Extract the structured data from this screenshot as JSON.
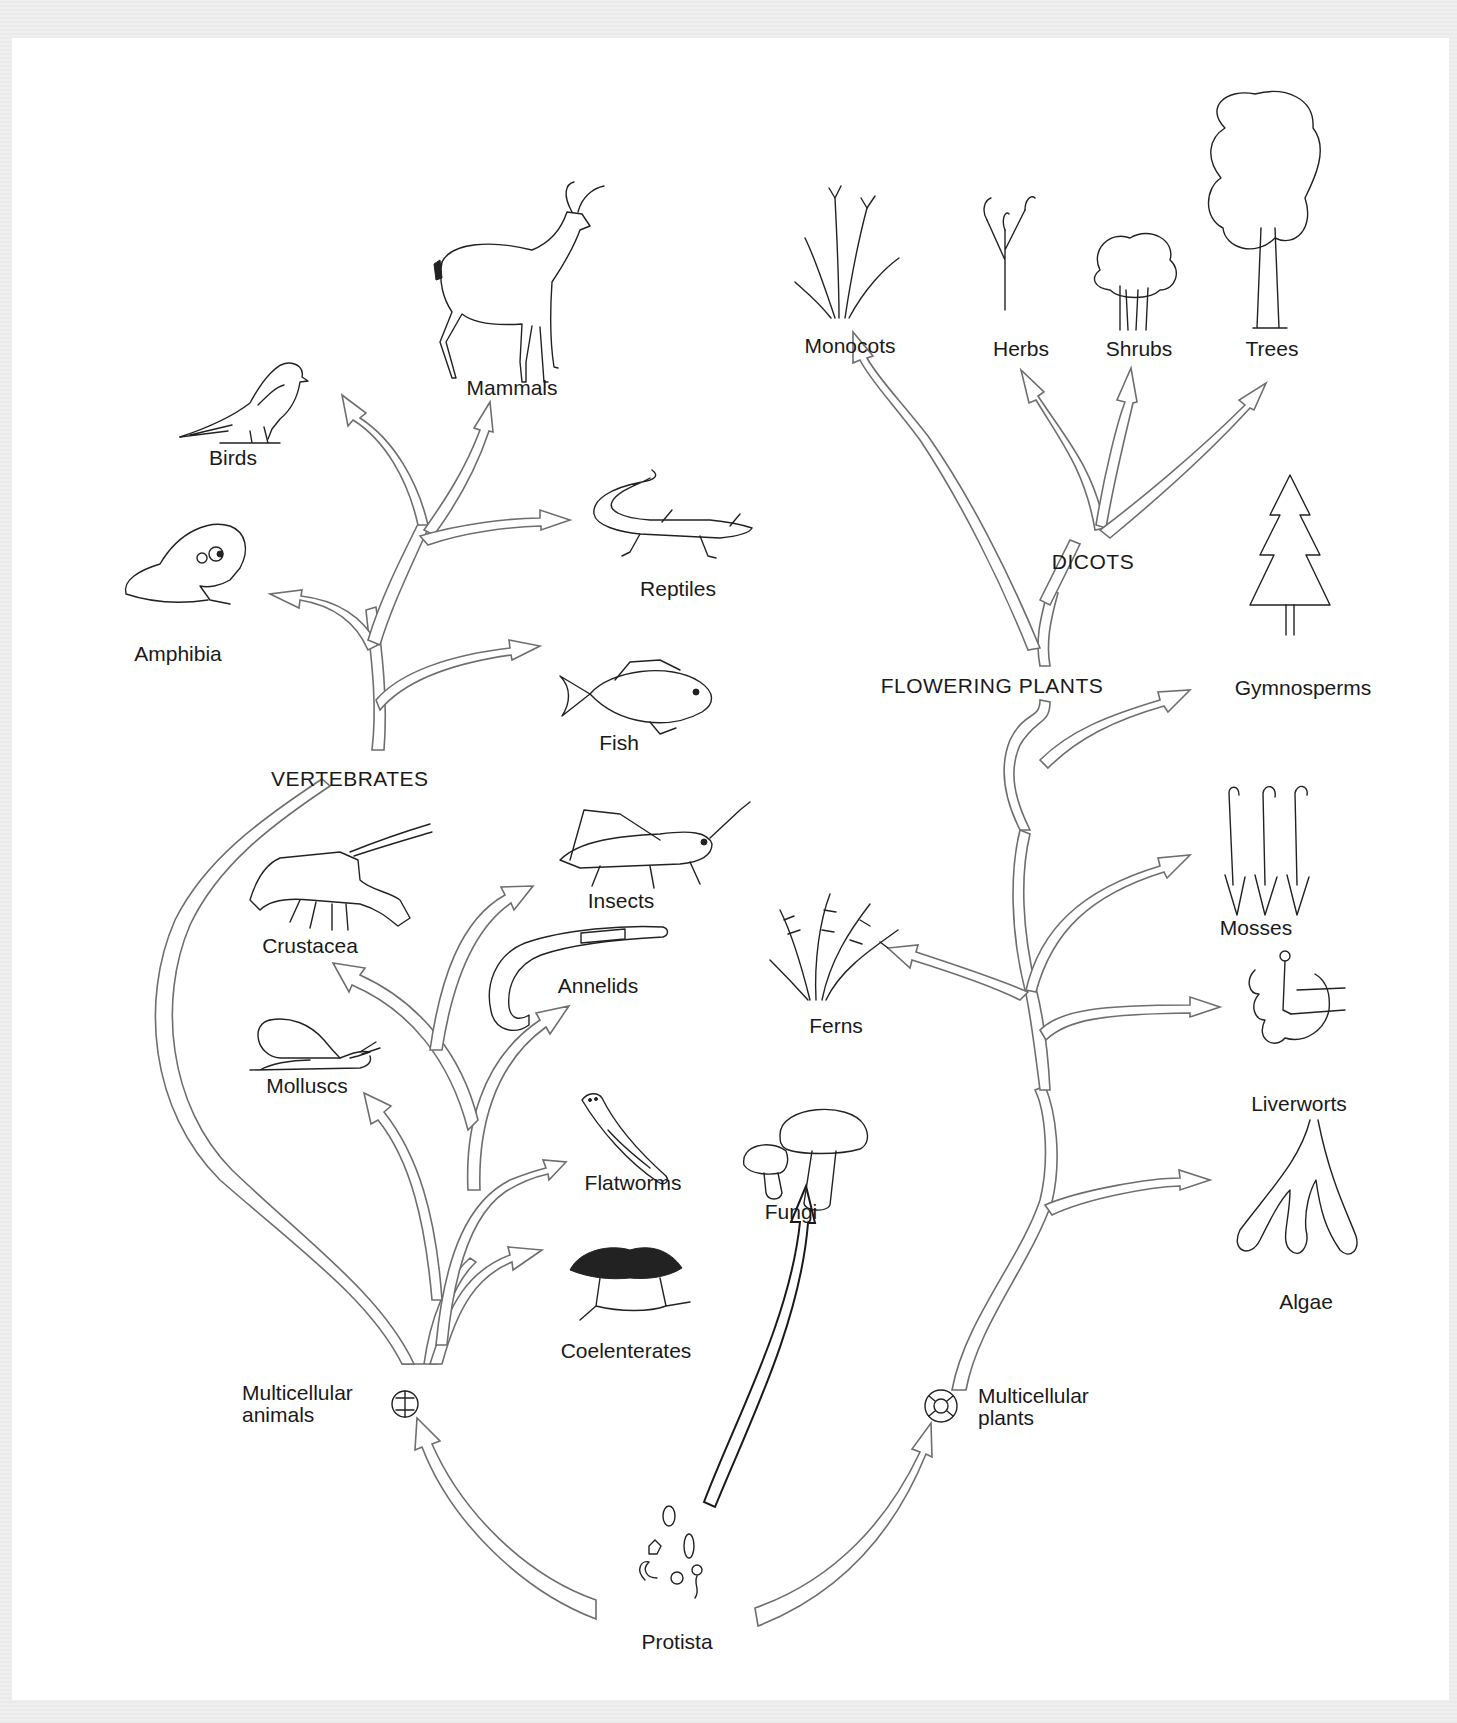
{
  "diagram": {
    "type": "evolutionary-tree",
    "root": "Protista",
    "colors": {
      "background": "#ffffff",
      "border": "#ececec",
      "branch_stroke": "#6e6e6e",
      "text": "#1a1a1a"
    }
  },
  "labels": {
    "birds": "Birds",
    "mammals": "Mammals",
    "reptiles": "Reptiles",
    "amphibia": "Amphibia",
    "fish": "Fish",
    "vertebrates": "VERTEBRATES",
    "insects": "Insects",
    "crustacea": "Crustacea",
    "annelids": "Annelids",
    "molluscs": "Molluscs",
    "flatworms": "Flatworms",
    "coelenterates": "Coelenterates",
    "multicellular_animals_1": "Multicellular",
    "multicellular_animals_2": "animals",
    "fungi": "Fungi",
    "ferns": "Ferns",
    "protista": "Protista",
    "multicellular_plants_1": "Multicellular",
    "multicellular_plants_2": "plants",
    "monocots": "Monocots",
    "herbs": "Herbs",
    "shrubs": "Shrubs",
    "trees": "Trees",
    "dicots": "DICOTS",
    "flowering_plants": "FLOWERING PLANTS",
    "gymnosperms": "Gymnosperms",
    "mosses": "Mosses",
    "liverworts": "Liverworts",
    "algae": "Algae"
  },
  "tree": {
    "Protista": [
      "Multicellular animals",
      "Fungi",
      "Multicellular plants"
    ],
    "Multicellular animals": [
      "Coelenterates",
      "Flatworms",
      "Molluscs",
      "Annelids",
      "Crustacea",
      "Insects",
      "VERTEBRATES"
    ],
    "VERTEBRATES": [
      "Fish",
      "Amphibia",
      "Reptiles",
      "Birds",
      "Mammals"
    ],
    "Multicellular plants": [
      "Algae",
      "Liverworts",
      "Mosses",
      "Ferns",
      "Gymnosperms",
      "FLOWERING PLANTS"
    ],
    "FLOWERING PLANTS": [
      "Monocots",
      "DICOTS"
    ],
    "DICOTS": [
      "Herbs",
      "Shrubs",
      "Trees"
    ]
  }
}
